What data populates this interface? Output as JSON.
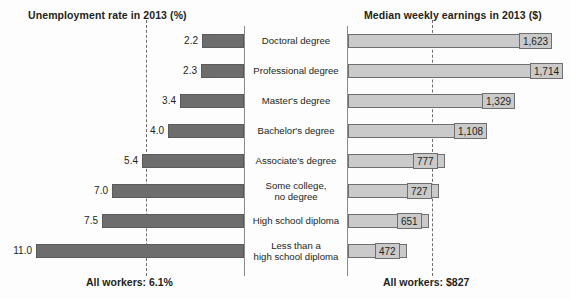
{
  "chart_data": {
    "type": "bar",
    "orientation": "horizontal-diverging",
    "categories": [
      "Doctoral degree",
      "Professional degree",
      "Master's degree",
      "Bachelor's degree",
      "Associate's degree",
      "Some college,\nno degree",
      "High school diploma",
      "Less than a\nhigh school diploma"
    ],
    "series": [
      {
        "name": "Unemployment rate in 2013 (%)",
        "side": "left",
        "unit": "%",
        "values": [
          2.2,
          2.3,
          3.4,
          4.0,
          5.4,
          7.0,
          7.5,
          11.0
        ],
        "labels": [
          "2.2",
          "2.3",
          "3.4",
          "4.0",
          "5.4",
          "7.0",
          "7.5",
          "11.0"
        ],
        "axis_max": 11.0,
        "reference_value": 6.1,
        "reference_label": "All workers: 6.1%",
        "color": "#6d6d6d"
      },
      {
        "name": "Median weekly earnings in 2013 ($)",
        "side": "right",
        "unit": "$",
        "values": [
          1623,
          1714,
          1329,
          1108,
          777,
          727,
          651,
          472
        ],
        "labels": [
          "1,623",
          "1,714",
          "1,329",
          "1,108",
          "777",
          "727",
          "651",
          "472"
        ],
        "axis_max": 1714,
        "reference_value": 827,
        "reference_label": "All workers: $827",
        "color": "#cacaca"
      }
    ],
    "grid": false,
    "legend": "none",
    "axis_titles": {
      "left": "Unemployment rate in 2013 (%)",
      "right": "Median weekly earnings in 2013 ($)"
    }
  },
  "headers": {
    "left": "Unemployment rate in 2013 (%)",
    "right": "Median weekly earnings in 2013 ($)"
  },
  "footnotes": {
    "left": "All workers: 6.1%",
    "right": "All workers: $827"
  },
  "rows": [
    {
      "label": "Doctoral degree",
      "label_line1": "Doctoral degree",
      "label_line2": "",
      "unemployment": "2.2",
      "earnings": "1,623"
    },
    {
      "label": "Professional degree",
      "label_line1": "Professional degree",
      "label_line2": "",
      "unemployment": "2.3",
      "earnings": "1,714"
    },
    {
      "label": "Master's degree",
      "label_line1": "Master's degree",
      "label_line2": "",
      "unemployment": "3.4",
      "earnings": "1,329"
    },
    {
      "label": "Bachelor's degree",
      "label_line1": "Bachelor's degree",
      "label_line2": "",
      "unemployment": "4.0",
      "earnings": "1,108"
    },
    {
      "label": "Associate's degree",
      "label_line1": "Associate's degree",
      "label_line2": "",
      "unemployment": "5.4",
      "earnings": "777"
    },
    {
      "label": "Some college, no degree",
      "label_line1": "Some college,",
      "label_line2": "no degree",
      "unemployment": "7.0",
      "earnings": "727"
    },
    {
      "label": "High school diploma",
      "label_line1": "High school diploma",
      "label_line2": "",
      "unemployment": "7.5",
      "earnings": "651"
    },
    {
      "label": "Less than a high school diploma",
      "label_line1": "Less than a",
      "label_line2": "high school diploma",
      "unemployment": "11.0",
      "earnings": "472"
    }
  ]
}
